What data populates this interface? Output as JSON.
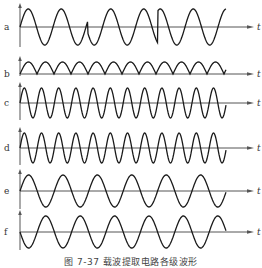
{
  "figure": {
    "caption": "图 7-37   载波提取电路各级波形",
    "time_axis_label": "t",
    "colors": {
      "wave": "#1a1a1a",
      "axis": "#555555",
      "background": "#ffffff"
    },
    "panels": [
      {
        "id": "a",
        "label": "a",
        "axis_y": 27,
        "amp": 18,
        "type": "psk",
        "period": 33,
        "phase_flips": [
          88,
          158
        ]
      },
      {
        "id": "b",
        "label": "b",
        "axis_y": 74,
        "amp": 12,
        "type": "rectified",
        "period": 17
      },
      {
        "id": "c",
        "label": "c",
        "axis_y": 103,
        "amp": 15,
        "type": "sine",
        "period": 17.2,
        "start": "up"
      },
      {
        "id": "d",
        "label": "d",
        "axis_y": 148,
        "amp": 15,
        "type": "sine",
        "period": 17.2,
        "start": "up"
      },
      {
        "id": "e",
        "label": "e",
        "axis_y": 191,
        "amp": 16,
        "type": "sine",
        "period": 34.4,
        "start": "up"
      },
      {
        "id": "f",
        "label": "f",
        "axis_y": 232,
        "amp": 16,
        "type": "sine",
        "period": 34.4,
        "start": "down"
      }
    ],
    "x_start": 20,
    "x_end_wave": 226,
    "x_end_axis": 254
  }
}
